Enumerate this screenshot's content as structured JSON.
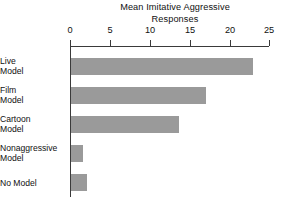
{
  "chart_data": {
    "type": "bar",
    "orientation": "horizontal",
    "title": "Mean Imitative Aggressive Responses",
    "title_lines": [
      "Mean Imitative Aggressive",
      "Responses"
    ],
    "categories": [
      "Live Model",
      "Film Model",
      "Cartoon Model",
      "Nonaggressive Model",
      "No Model"
    ],
    "category_lines": [
      [
        "Live",
        "Model"
      ],
      [
        "Film",
        "Model"
      ],
      [
        "Cartoon",
        "Model"
      ],
      [
        "Nonaggressive",
        "Model"
      ],
      [
        "No Model"
      ]
    ],
    "values": [
      23,
      17,
      13.6,
      1.5,
      2
    ],
    "xlabel": "",
    "ylabel": "",
    "xlim": [
      0,
      25
    ],
    "xticks": [
      0,
      5,
      10,
      15,
      20,
      25
    ],
    "xtick_labels": [
      "0",
      "5",
      "10",
      "15",
      "20",
      "25"
    ],
    "grid": false,
    "legend": false,
    "bar_color": "#9a9a9a",
    "axis_color": "#3a3a3a",
    "background": "#ffffff"
  }
}
